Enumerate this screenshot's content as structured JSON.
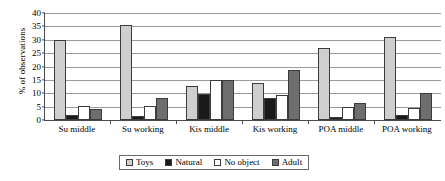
{
  "chart_data": {
    "type": "bar",
    "title": "",
    "xlabel": "",
    "ylabel": "% of observations",
    "ylim": [
      0,
      40
    ],
    "ytick_step": 5,
    "yticks": [
      0,
      5,
      10,
      15,
      20,
      25,
      30,
      35,
      40
    ],
    "grid": true,
    "legend_position": "bottom",
    "categories": [
      "Su middle",
      "Su working",
      "Kis middle",
      "Kis working",
      "POA middle",
      "POA working"
    ],
    "series": [
      {
        "name": "Toys",
        "color": "#cfcfcf",
        "values": [
          30.0,
          35.5,
          12.8,
          13.8,
          26.8,
          31.0
        ]
      },
      {
        "name": "Natural",
        "color": "#1a1a1a",
        "values": [
          1.8,
          1.5,
          9.7,
          8.3,
          1.3,
          2.0
        ]
      },
      {
        "name": "No object",
        "color": "#ffffff",
        "values": [
          5.3,
          5.3,
          15.0,
          9.3,
          5.0,
          4.5
        ]
      },
      {
        "name": "Adult",
        "color": "#6e6e6e",
        "values": [
          4.0,
          8.3,
          15.0,
          18.7,
          6.5,
          10.2
        ]
      }
    ]
  }
}
